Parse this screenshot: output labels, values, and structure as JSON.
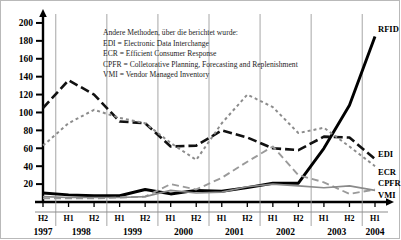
{
  "chart_data": {
    "type": "line",
    "title": "",
    "xlabel": "",
    "ylabel": "",
    "ylim": [
      0,
      210
    ],
    "yticks": [
      20,
      40,
      60,
      80,
      100,
      120,
      140,
      160,
      180,
      200
    ],
    "grid": "vertical year separators only",
    "legend_position": "right of plot (series end labels) + inline text block top-right",
    "categories": [
      "H2",
      "H1",
      "H2",
      "H1",
      "H2",
      "H1",
      "H2",
      "H1",
      "H2",
      "H1",
      "H2",
      "H1",
      "H2",
      "H1"
    ],
    "x": [
      {
        "half": "H2",
        "year": "1997"
      },
      {
        "half": "H1",
        "year": "1998"
      },
      {
        "half": "H2",
        "year": "1998"
      },
      {
        "half": "H1",
        "year": "1999"
      },
      {
        "half": "H2",
        "year": "1999"
      },
      {
        "half": "H1",
        "year": "2000"
      },
      {
        "half": "H2",
        "year": "2000"
      },
      {
        "half": "H1",
        "year": "2001"
      },
      {
        "half": "H2",
        "year": "2001"
      },
      {
        "half": "H1",
        "year": "2002"
      },
      {
        "half": "H2",
        "year": "2002"
      },
      {
        "half": "H1",
        "year": "2003"
      },
      {
        "half": "H2",
        "year": "2003"
      },
      {
        "half": "H1",
        "year": "2004"
      }
    ],
    "series": [
      {
        "name": "RFID",
        "style": "solid-thick-black",
        "color": "#000000",
        "values": [
          10,
          8,
          7,
          7,
          14,
          9,
          13,
          12,
          16,
          21,
          21,
          60,
          108,
          185
        ]
      },
      {
        "name": "EDI",
        "style": "dashed-black",
        "color": "#111111",
        "values": [
          105,
          136,
          120,
          90,
          88,
          62,
          63,
          80,
          72,
          60,
          58,
          73,
          72,
          48
        ]
      },
      {
        "name": "ECR",
        "style": "dotted-gray",
        "color": "#8c8c8c",
        "values": [
          63,
          88,
          103,
          94,
          88,
          66,
          47,
          88,
          120,
          106,
          77,
          83,
          62,
          40
        ]
      },
      {
        "name": "CPFR",
        "style": "dashed-gray",
        "color": "#9a9a9a",
        "values": [
          4,
          4,
          4,
          5,
          6,
          20,
          14,
          27,
          45,
          62,
          30,
          22,
          9,
          14
        ]
      },
      {
        "name": "VMI",
        "style": "solid-thin-gray",
        "color": "#8a8a8a",
        "values": [
          6,
          5,
          5,
          5,
          6,
          13,
          10,
          11,
          17,
          20,
          18,
          16,
          18,
          13
        ]
      }
    ]
  },
  "axis": {
    "y_ticks": [
      "200",
      "180",
      "160",
      "140",
      "120",
      "100",
      "80",
      "60",
      "40",
      "20"
    ],
    "x_halves": [
      "H2",
      "H1",
      "H2",
      "H1",
      "H2",
      "H1",
      "H2",
      "H1",
      "H2",
      "H1",
      "H2",
      "H1",
      "H2",
      "H1"
    ],
    "x_years": [
      "1997",
      "1998",
      "1999",
      "2000",
      "2001",
      "2002",
      "2003",
      "2004"
    ]
  },
  "legend": {
    "title": "Andere Methoden, über die berichtet wurde:",
    "entries": [
      "EDI = Electronic Data Interchange",
      "ECR = Efficient Consumer Response",
      "CPFR = Colletorative Planning, Forecasting and Replenishment",
      "VMI = Vendor Managed Inventory"
    ]
  },
  "series_end_labels": {
    "rfid": "RFID",
    "edi": "EDI",
    "ecr": "ECR",
    "cpfr": "CPFR",
    "vmi": "VMI"
  }
}
